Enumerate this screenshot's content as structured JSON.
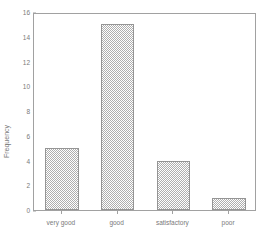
{
  "chart_data": {
    "type": "bar",
    "title": "",
    "xlabel": "",
    "ylabel": "Frequency",
    "categories": [
      "very good",
      "good",
      "satisfactory",
      "poor"
    ],
    "values": [
      5,
      15,
      4,
      1
    ],
    "ylim": [
      0,
      16
    ],
    "yticks": [
      0,
      2,
      4,
      6,
      8,
      10,
      12,
      14,
      16
    ],
    "ytick_labels": [
      "0",
      "2",
      "4",
      "6",
      "8",
      "10",
      "12",
      "14",
      "16"
    ],
    "grid": false,
    "legend": null,
    "bar_fill": "#a9a9a9",
    "bar_edge": "#8d8d8d",
    "axis_color": "#9a9a9a",
    "text_color": "#6f6f6f",
    "background": "#ffffff"
  }
}
